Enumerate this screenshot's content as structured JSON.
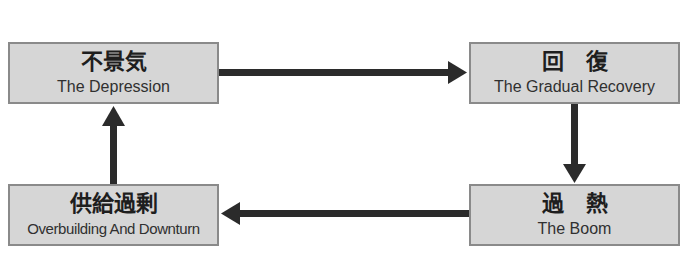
{
  "diagram": {
    "title": "",
    "nodes": [
      {
        "id": "depression",
        "jp": "不景気",
        "en": "The Depression"
      },
      {
        "id": "recovery",
        "jp": "回　復",
        "en": "The Gradual Recovery"
      },
      {
        "id": "boom",
        "jp": "過　熱",
        "en": "The Boom"
      },
      {
        "id": "overbuilding",
        "jp": "供給過剰",
        "en": "Overbuilding And Downturn"
      }
    ],
    "edges": [
      {
        "from": "depression",
        "to": "recovery",
        "direction": "right"
      },
      {
        "from": "recovery",
        "to": "boom",
        "direction": "down"
      },
      {
        "from": "boom",
        "to": "overbuilding",
        "direction": "left"
      },
      {
        "from": "overbuilding",
        "to": "depression",
        "direction": "up"
      }
    ],
    "colors": {
      "box_fill": "#d6d6d6",
      "box_border": "#8a8a8a",
      "arrow": "#2b2b2b"
    }
  }
}
